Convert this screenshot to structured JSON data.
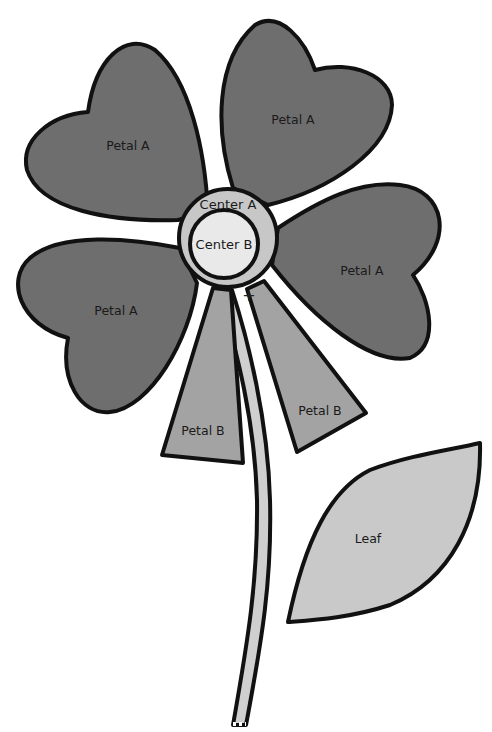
{
  "diagram": {
    "type": "flower-pattern",
    "colors": {
      "petal_a": "#6e6e6e",
      "petal_b": "#a3a3a3",
      "center_a": "#c7c7c7",
      "center_b": "#e9e9e9",
      "stem": "#cfcfcf",
      "leaf": "#c9c9c9",
      "outline": "#111111",
      "background": "#ffffff"
    },
    "parts": {
      "petal_a_upper_left": {
        "label": "Petal A"
      },
      "petal_a_upper_right": {
        "label": "Petal A"
      },
      "petal_a_right": {
        "label": "Petal A"
      },
      "petal_a_lower_left": {
        "label": "Petal A"
      },
      "petal_b_left": {
        "label": "Petal B"
      },
      "petal_b_right": {
        "label": "Petal B"
      },
      "center_a": {
        "label": "Center A"
      },
      "center_b": {
        "label": "Center B"
      },
      "leaf": {
        "label": "Leaf"
      },
      "stem": {
        "label": ""
      }
    },
    "markers": {
      "registration_mark": "+"
    }
  }
}
